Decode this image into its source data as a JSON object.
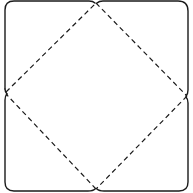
{
  "diagram": {
    "type": "envelope-template",
    "colors": {
      "line": "#1a1a1a",
      "background": "#ffffff"
    },
    "midpoints": {
      "top": [
        96,
        2
      ],
      "right": [
        187,
        96
      ],
      "bottom": [
        96,
        190
      ],
      "left": [
        5,
        93
      ]
    },
    "fold_lines": "dashed",
    "cut_lines": "solid",
    "flaps": [
      "top-left",
      "top-right",
      "bottom-left",
      "bottom-right"
    ]
  }
}
